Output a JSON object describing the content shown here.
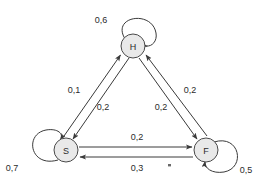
{
  "diagram": {
    "type": "state-transition-diagram",
    "decimal_separator": ",",
    "nodes": [
      {
        "id": "H",
        "label": "H",
        "cx": 133,
        "cy": 46,
        "r": 12
      },
      {
        "id": "S",
        "label": "S",
        "cx": 66,
        "cy": 150,
        "r": 12
      },
      {
        "id": "F",
        "label": "F",
        "cx": 206,
        "cy": 150,
        "r": 12
      }
    ],
    "self_loops": [
      {
        "id": "H-self",
        "node": "H",
        "label": "0,6",
        "label_x": 101,
        "label_y": 20
      },
      {
        "id": "S-self",
        "node": "S",
        "label": "0,7",
        "label_x": 12,
        "label_y": 168
      },
      {
        "id": "F-self",
        "node": "F",
        "label": "0,5",
        "label_x": 246,
        "label_y": 170
      }
    ],
    "edges": [
      {
        "id": "S-to-H",
        "from": "S",
        "to": "H",
        "label": "0,1",
        "label_x": 74,
        "label_y": 90
      },
      {
        "id": "H-to-S",
        "from": "H",
        "to": "S",
        "label": "0,2",
        "label_x": 103,
        "label_y": 107
      },
      {
        "id": "H-to-F",
        "from": "H",
        "to": "F",
        "label": "0,2",
        "label_x": 161,
        "label_y": 107
      },
      {
        "id": "F-to-H",
        "from": "F",
        "to": "H",
        "label": "0,2",
        "label_x": 190,
        "label_y": 90
      },
      {
        "id": "S-to-F",
        "from": "S",
        "to": "F",
        "label": "0,2",
        "label_x": 137,
        "label_y": 137
      },
      {
        "id": "F-to-S",
        "from": "F",
        "to": "S",
        "label": "0,3",
        "label_x": 137,
        "label_y": 168
      }
    ],
    "colors": {
      "node_fill": "#e9e9e9",
      "node_stroke": "#4a4a4a",
      "edge_stroke": "#3a3a3a",
      "text": "#2b2b2b",
      "background": "#ffffff"
    }
  }
}
